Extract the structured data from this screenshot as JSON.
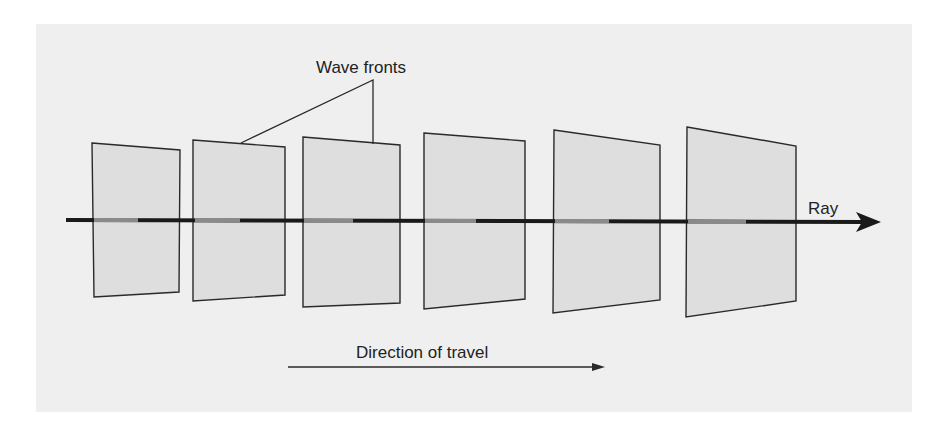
{
  "diagram": {
    "labels": {
      "wave_fronts": "Wave fronts",
      "ray": "Ray",
      "direction": "Direction of travel"
    },
    "colors": {
      "background_panel": "#efefef",
      "wave_front_fill": "#dedede",
      "stroke": "#2a2a2a",
      "ray_inner": "#8a8a8a"
    },
    "wave_fronts": [
      {
        "id": 1,
        "points": "92,143 180,150 179,292 94,297"
      },
      {
        "id": 2,
        "points": "193,140 285,147 285,295 193,301"
      },
      {
        "id": 3,
        "points": "303,137 400,145 400,303 303,307"
      },
      {
        "id": 4,
        "points": "424,133 525,141 525,299 424,309"
      },
      {
        "id": 5,
        "points": "554,130 660,145 660,300 553,313"
      },
      {
        "id": 6,
        "points": "687,127 796,146 796,301 686,317"
      }
    ]
  }
}
